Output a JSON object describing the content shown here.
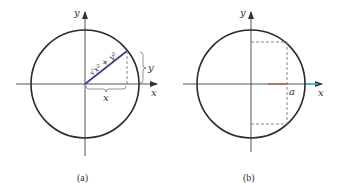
{
  "panels": [
    {
      "id": "a",
      "caption": "(a)",
      "axis_labels": {
        "x": "x",
        "y": "y"
      },
      "radius_label": "√x² + y²",
      "segment_labels": {
        "horizontal": "x",
        "vertical": "y"
      }
    },
    {
      "id": "b",
      "caption": "(b)",
      "axis_labels": {
        "x": "x",
        "y": "y"
      },
      "point_label": "a"
    }
  ],
  "colors": {
    "circle": "#2a2a2a",
    "axis": "#555555",
    "radius_line": "#3c3c8c",
    "dashed": "#777777",
    "segment_red": "#c0392b",
    "segment_cyan": "#2bc3d6"
  }
}
